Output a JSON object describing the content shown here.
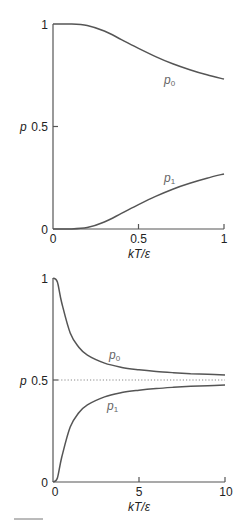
{
  "chart_data": [
    {
      "type": "line",
      "title": "",
      "xlabel": "kT/ε",
      "ylabel": "p",
      "xlim": [
        0,
        1
      ],
      "ylim": [
        0,
        1
      ],
      "grid": false,
      "x_ticks": [
        "0",
        "0.5",
        "1"
      ],
      "y_ticks": [
        "0",
        "0.5",
        "1"
      ],
      "x": [
        0,
        0.1,
        0.2,
        0.3,
        0.4,
        0.5,
        0.6,
        0.7,
        0.8,
        0.9,
        1.0
      ],
      "series": [
        {
          "name": "p0",
          "label_main": "p",
          "label_sub": "0",
          "values": [
            1.0,
            1.0,
            0.993,
            0.966,
            0.924,
            0.881,
            0.841,
            0.806,
            0.777,
            0.752,
            0.731
          ]
        },
        {
          "name": "p1",
          "label_main": "p",
          "label_sub": "1",
          "values": [
            0.0,
            0.0,
            0.007,
            0.034,
            0.076,
            0.119,
            0.159,
            0.194,
            0.223,
            0.248,
            0.269
          ]
        }
      ],
      "legend_position": "inline"
    },
    {
      "type": "line",
      "title": "",
      "xlabel": "kT/ε",
      "ylabel": "p",
      "xlim": [
        0,
        10
      ],
      "ylim": [
        0,
        1
      ],
      "grid": false,
      "x_ticks": [
        "0",
        "5",
        "10"
      ],
      "y_ticks": [
        "0",
        "0.5",
        "1"
      ],
      "reference_line": {
        "y": 0.5,
        "style": "dotted"
      },
      "x": [
        0,
        0.25,
        0.5,
        1,
        1.5,
        2,
        3,
        4,
        5,
        6,
        7,
        8,
        9,
        10
      ],
      "series": [
        {
          "name": "p0",
          "label_main": "p",
          "label_sub": "0",
          "values": [
            1.0,
            0.982,
            0.881,
            0.731,
            0.661,
            0.622,
            0.583,
            0.562,
            0.55,
            0.542,
            0.536,
            0.531,
            0.528,
            0.525
          ]
        },
        {
          "name": "p1",
          "label_main": "p",
          "label_sub": "1",
          "values": [
            0.0,
            0.018,
            0.119,
            0.269,
            0.339,
            0.378,
            0.417,
            0.438,
            0.45,
            0.458,
            0.464,
            0.469,
            0.472,
            0.475
          ]
        }
      ],
      "legend_position": "inline"
    }
  ],
  "labels": {
    "top": {
      "y_axis": "p",
      "x_axis": "kT/ε",
      "y_ticks": [
        "0",
        "0.5",
        "1"
      ],
      "x_ticks": [
        "0",
        "0.5",
        "1"
      ],
      "p0_main": "p",
      "p0_sub": "0",
      "p1_main": "p",
      "p1_sub": "1"
    },
    "bottom": {
      "y_axis": "p",
      "x_axis": "kT/ε",
      "y_ticks": [
        "0",
        "0.5",
        "1"
      ],
      "x_ticks": [
        "0",
        "5",
        "10"
      ],
      "p0_main": "p",
      "p0_sub": "0",
      "p1_main": "p",
      "p1_sub": "1"
    }
  }
}
